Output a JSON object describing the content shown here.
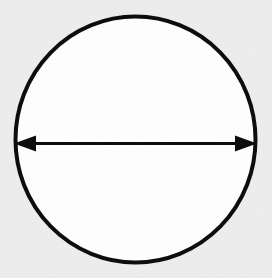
{
  "figure": {
    "kind": "geometry-diagram",
    "caption": "",
    "canvas": {
      "width": 272,
      "height": 278,
      "background_color": "#eeeeee",
      "ink_color": "#111111"
    },
    "shapes": {
      "circle": {
        "name": "circle-outline",
        "center_x": 135.5,
        "center_y": 139.5,
        "radius_x": 122,
        "radius_y": 125,
        "stroke_width": 4,
        "stroke_color": "#111111",
        "fill_color": "#ffffff"
      },
      "diameter_arrow": {
        "name": "diameter-double-arrow",
        "label": "",
        "start_x": 14,
        "end_x": 257,
        "y": 143.5,
        "line_width": 3,
        "stroke_color": "#111111",
        "arrowhead_length": 22,
        "arrowhead_width": 16,
        "heads": "both"
      }
    },
    "annotations": []
  },
  "chart_data": {
    "type": "diagram",
    "elements": [
      {
        "id": "circle",
        "shape": "circle",
        "center": [
          135.5,
          139.5
        ],
        "radius": 123.5,
        "fill": "#ffffff",
        "stroke": "#111111",
        "stroke_width": 4
      },
      {
        "id": "diameter",
        "shape": "double-headed-arrow",
        "from": [
          14,
          143.5
        ],
        "to": [
          257,
          143.5
        ],
        "length_px": 243,
        "stroke": "#111111",
        "stroke_width": 3
      }
    ],
    "labels": [],
    "xlabel": "",
    "ylabel": ""
  }
}
